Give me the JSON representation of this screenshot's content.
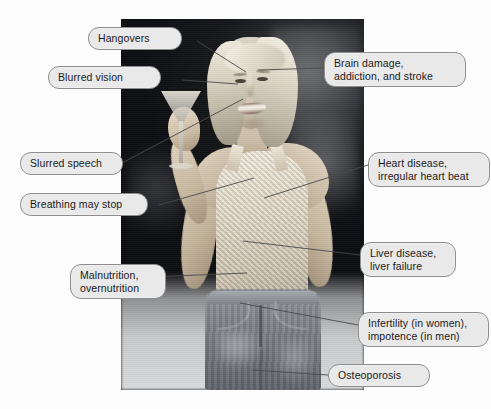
{
  "diagram": {
    "background_color": "#fdfdfd",
    "label_fill_color": "#e9e9e9",
    "label_border_color": "#8e8e8e",
    "leader_line_color": "#4a4a4a"
  },
  "callouts": [
    {
      "id": "hangovers",
      "text": "Hangovers"
    },
    {
      "id": "blurred-vision",
      "text": "Blurred vision"
    },
    {
      "id": "brain-damage",
      "text": "Brain damage,\naddiction, and stroke"
    },
    {
      "id": "slurred-speech",
      "text": "Slurred speech"
    },
    {
      "id": "breathing",
      "text": "Breathing may stop"
    },
    {
      "id": "heart-disease",
      "text": "Heart disease,\nirregular heart beat"
    },
    {
      "id": "liver-disease",
      "text": "Liver disease,\nliver failure"
    },
    {
      "id": "malnutrition",
      "text": "Malnutrition,\novernutrition"
    },
    {
      "id": "infertility",
      "text": "Infertility (in women),\nimpotence (in men)"
    },
    {
      "id": "osteoporosis",
      "text": "Osteoporosis"
    }
  ]
}
